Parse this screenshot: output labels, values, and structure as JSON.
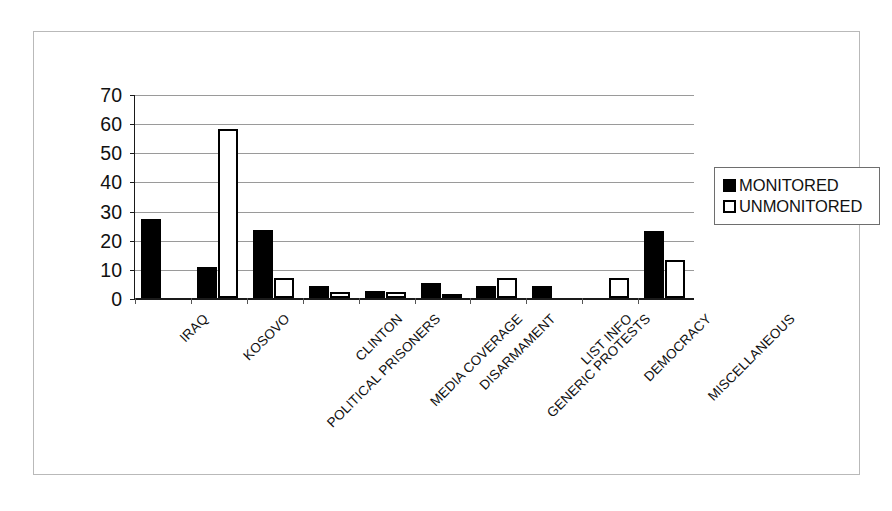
{
  "chart_data": {
    "type": "bar",
    "title": "",
    "subtitle": "",
    "xlabel": "",
    "ylabel": "",
    "ylim": [
      0,
      70
    ],
    "ytick_step": 10,
    "yticks": [
      0,
      10,
      20,
      30,
      40,
      50,
      60,
      70
    ],
    "grid": true,
    "legend_position": "right",
    "orientation": "vertical",
    "grouping": "grouped",
    "categories": [
      "IRAQ",
      "KOSOVO",
      "POLITICAL PRISONERS",
      "CLINTON",
      "MEDIA COVERAGE",
      "DISARMAMENT",
      "GENERIC PROTESTS",
      "LIST INFO",
      "DEMOCRACY",
      "MISCELLANEOUS"
    ],
    "series": [
      {
        "name": "MONITORED",
        "color": "#000000",
        "fill": "solid",
        "values": [
          27,
          10.5,
          23.5,
          4,
          2.5,
          5,
          4,
          4,
          0,
          23
        ]
      },
      {
        "name": "UNMONITORED",
        "color": "#ffffff",
        "fill": "hollow",
        "values": [
          0,
          58,
          7,
          2,
          2,
          1.5,
          7,
          0,
          7,
          13
        ]
      }
    ]
  },
  "legend": {
    "items": [
      {
        "label": "MONITORED",
        "swatch": "filled-square"
      },
      {
        "label": "UNMONITORED",
        "swatch": "hollow-square"
      }
    ]
  },
  "axis": {
    "y_tick_labels": [
      "70",
      "60",
      "50",
      "40",
      "30",
      "20",
      "10",
      "0"
    ]
  },
  "colors": {
    "monitored": "#000000",
    "unmonitored": "#ffffff",
    "axis": "#1a1a1a",
    "grid": "#9a9a9a",
    "frame": "#b9b9b9",
    "text": "#111111"
  }
}
